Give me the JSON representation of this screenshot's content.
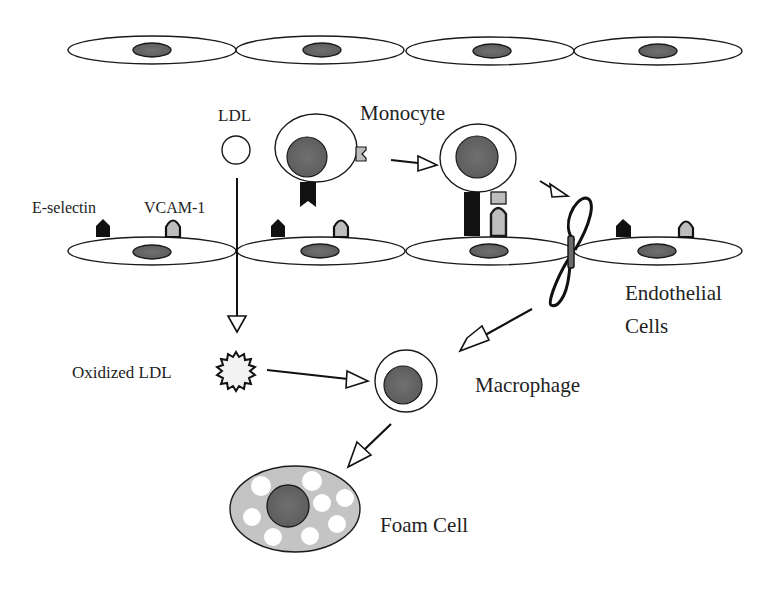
{
  "diagram": {
    "labels": {
      "ldl": "LDL",
      "monocyte": "Monocyte",
      "e_selectin": "E-selectin",
      "vcam1": "VCAM-1",
      "endothelial_line1": "Endothelial",
      "endothelial_line2": "Cells",
      "oxidized_ldl": "Oxidized LDL",
      "macrophage": "Macrophage",
      "foam_cell": "Foam Cell"
    },
    "colors": {
      "nucleus": "#6a6a6a",
      "foam_cytoplasm": "#c4c4c4",
      "vcam_fill": "#bdbdbd",
      "outline": "#1a1a1a",
      "background": "#ffffff"
    },
    "nodes": [
      {
        "id": "top-endothelium",
        "kind": "cell-row",
        "count": 4
      },
      {
        "id": "ldl",
        "kind": "particle"
      },
      {
        "id": "monocyte-free",
        "kind": "cell"
      },
      {
        "id": "monocyte-adherent",
        "kind": "cell"
      },
      {
        "id": "monocyte-transmigrating",
        "kind": "cell"
      },
      {
        "id": "bottom-endothelium",
        "kind": "cell-row",
        "count": 4
      },
      {
        "id": "oxidized-ldl",
        "kind": "particle"
      },
      {
        "id": "macrophage",
        "kind": "cell"
      },
      {
        "id": "foam-cell",
        "kind": "cell"
      }
    ],
    "edges": [
      {
        "from": "ldl",
        "to": "oxidized-ldl"
      },
      {
        "from": "monocyte-free",
        "to": "monocyte-adherent"
      },
      {
        "from": "monocyte-adherent",
        "to": "monocyte-transmigrating"
      },
      {
        "from": "monocyte-transmigrating",
        "to": "macrophage"
      },
      {
        "from": "oxidized-ldl",
        "to": "macrophage"
      },
      {
        "from": "macrophage",
        "to": "foam-cell"
      }
    ]
  }
}
